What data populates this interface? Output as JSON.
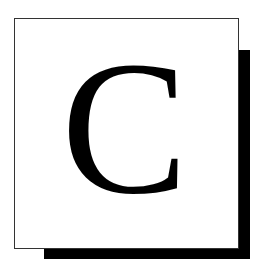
{
  "tile": {
    "letter": "C",
    "background": "#ffffff",
    "border_color": "#333333",
    "shadow_color": "#000000",
    "letter_color": "#000000"
  }
}
